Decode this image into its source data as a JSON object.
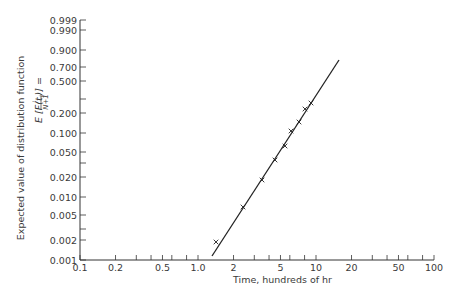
{
  "chart_data": {
    "type": "scatter",
    "title": "",
    "xlabel": "Time, hundreds of hr",
    "ylabel": "Expected value of distribution function",
    "ylabel_formula": "E [F(t_i)] = i/(N+1)",
    "x_scale": "log",
    "y_scale": "probability",
    "xlim": [
      0.1,
      100
    ],
    "ylim": [
      0.001,
      0.999
    ],
    "x_ticks": [
      {
        "value": 0.1,
        "label": "0.1"
      },
      {
        "value": 0.2,
        "label": "0.2"
      },
      {
        "value": 0.3,
        "label": ""
      },
      {
        "value": 0.4,
        "label": ""
      },
      {
        "value": 0.5,
        "label": "0.5"
      },
      {
        "value": 0.6,
        "label": ""
      },
      {
        "value": 0.8,
        "label": ""
      },
      {
        "value": 1.0,
        "label": "1.0"
      },
      {
        "value": 2,
        "label": "2"
      },
      {
        "value": 3,
        "label": ""
      },
      {
        "value": 4,
        "label": ""
      },
      {
        "value": 5,
        "label": "5"
      },
      {
        "value": 6,
        "label": ""
      },
      {
        "value": 8,
        "label": ""
      },
      {
        "value": 10,
        "label": "10"
      },
      {
        "value": 20,
        "label": "20"
      },
      {
        "value": 30,
        "label": ""
      },
      {
        "value": 40,
        "label": ""
      },
      {
        "value": 50,
        "label": "50"
      },
      {
        "value": 60,
        "label": ""
      },
      {
        "value": 80,
        "label": ""
      },
      {
        "value": 100,
        "label": "100"
      }
    ],
    "y_ticks": [
      {
        "value": 0.999,
        "label": "0.999",
        "py": 20
      },
      {
        "value": 0.99,
        "label": "0.990",
        "py": 30
      },
      {
        "value": 0.9,
        "label": "0.900",
        "py": 50
      },
      {
        "value": 0.7,
        "label": "0.700",
        "py": 67
      },
      {
        "value": 0.5,
        "label": "0.500",
        "py": 81
      },
      {
        "value": 0.3,
        "label": "",
        "py": 99
      },
      {
        "value": 0.2,
        "label": "0.200",
        "py": 113
      },
      {
        "value": 0.1,
        "label": "0.100",
        "py": 133
      },
      {
        "value": 0.05,
        "label": "0.050",
        "py": 152
      },
      {
        "value": 0.03,
        "label": "",
        "py": 163
      },
      {
        "value": 0.02,
        "label": "0.020",
        "py": 177
      },
      {
        "value": 0.01,
        "label": "0.010",
        "py": 197
      },
      {
        "value": 0.005,
        "label": "0.005",
        "py": 215
      },
      {
        "value": 0.003,
        "label": "",
        "py": 229
      },
      {
        "value": 0.002,
        "label": "0.002",
        "py": 240
      },
      {
        "value": 0.001,
        "label": "0.001",
        "py": 260
      }
    ],
    "series": [
      {
        "name": "observed failures",
        "marker": "x",
        "points": [
          {
            "x": 1.42,
            "y": 0.0019,
            "px": 216,
            "py": 242
          },
          {
            "x": 2.4,
            "y": 0.007,
            "px": 243,
            "py": 207
          },
          {
            "x": 3.5,
            "y": 0.018,
            "px": 262,
            "py": 180
          },
          {
            "x": 4.5,
            "y": 0.04,
            "px": 275,
            "py": 160
          },
          {
            "x": 5.5,
            "y": 0.06,
            "px": 285,
            "py": 146
          },
          {
            "x": 6.1,
            "y": 0.1,
            "px": 291,
            "py": 131
          },
          {
            "x": 7.2,
            "y": 0.14,
            "px": 299,
            "py": 122
          },
          {
            "x": 8.1,
            "y": 0.21,
            "px": 305,
            "py": 109
          },
          {
            "x": 9.1,
            "y": 0.26,
            "px": 311,
            "py": 103
          }
        ]
      },
      {
        "name": "fitted line",
        "type": "line",
        "points": [
          {
            "x": 1.3,
            "y": 0.0012,
            "px": 212,
            "py": 256
          },
          {
            "x": 15.5,
            "y": 0.75,
            "px": 339,
            "py": 60
          }
        ]
      }
    ],
    "grid": false,
    "legend": null
  },
  "axes": {
    "x_label": "Time, hundreds of hr",
    "y_label_line1": "Expected value of distribution function",
    "y_label_line2_lhs": "E [F(t",
    "y_label_line2_sub": "i",
    "y_label_line2_mid": ")] =",
    "y_label_frac_num": "i",
    "y_label_frac_den": "N+1"
  }
}
